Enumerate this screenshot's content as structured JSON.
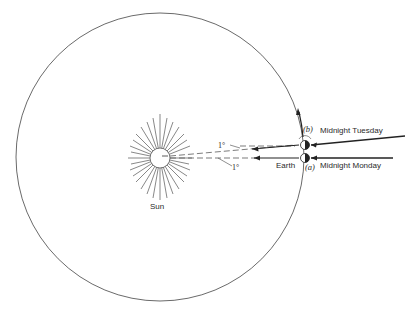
{
  "diagram": {
    "type": "orbit-diagram",
    "labels": {
      "sun": "Sun",
      "earth": "Earth",
      "position_a": "(a)",
      "position_b": "(b)",
      "midnight_monday": "Midnight Monday",
      "midnight_tuesday": "Midnight Tuesday",
      "angle_top": "1°",
      "angle_bottom": "1°"
    },
    "colors": {
      "line": "#333333",
      "background": "#ffffff"
    }
  }
}
